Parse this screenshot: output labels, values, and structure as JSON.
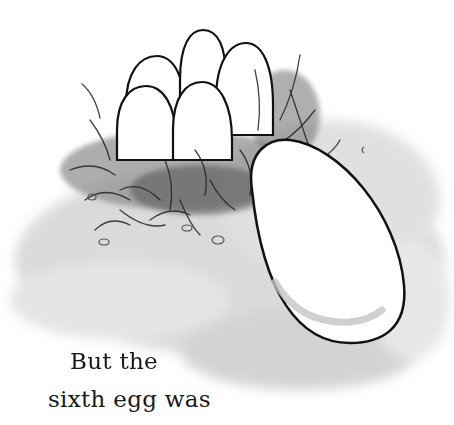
{
  "caption": {
    "line1": "But the",
    "line2": "sixth egg was"
  },
  "illustration": {
    "nest_eggs": 5,
    "large_egg": 1,
    "palette": {
      "ink": "#111111",
      "wash": "#9a9a9a",
      "paper": "#ffffff"
    }
  }
}
